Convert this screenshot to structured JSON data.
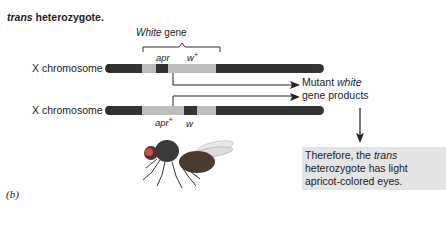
{
  "title": {
    "italic": "trans",
    "rest": " heterozygote."
  },
  "gene_region": {
    "italic": "White",
    "rest": " gene"
  },
  "chromosomes": [
    {
      "label": "X chromosome 1",
      "alleles": [
        {
          "name": "apr",
          "sup": ""
        },
        {
          "name": "w",
          "sup": "+"
        }
      ]
    },
    {
      "label": "X chromosome 2",
      "alleles": [
        {
          "name": "apr",
          "sup": "+"
        },
        {
          "name": "w",
          "sup": ""
        }
      ]
    }
  ],
  "products": {
    "line1_pre": "Mutant ",
    "line1_italic": "white",
    "line2": "gene products"
  },
  "conclusion": {
    "pre": "Therefore, the ",
    "italic": "trans",
    "post": " heterozygote has light apricot-colored eyes."
  },
  "panel_label": "(b)",
  "colors": {
    "dark_band": "#333333",
    "light_band": "#bdbdbd",
    "box_bg": "#e4e4e4"
  },
  "figure": {
    "image": "fruit-fly-illustration"
  }
}
